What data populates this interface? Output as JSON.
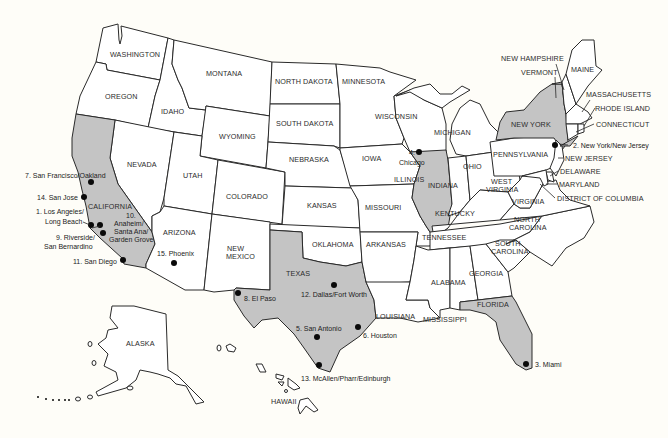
{
  "map": {
    "title": "",
    "highlight_color": "#c4c4c4",
    "background_color": "#fefdf8",
    "highlighted_states": [
      "CALIFORNIA",
      "TEXAS",
      "ILLINOIS",
      "NEW YORK",
      "FLORIDA"
    ],
    "state_labels": {
      "washington": "WASHINGTON",
      "oregon": "OREGON",
      "idaho": "IDAHO",
      "montana": "MONTANA",
      "wyoming": "WYOMING",
      "nevada": "NEVADA",
      "california": "CALIFORNIA",
      "utah": "UTAH",
      "colorado": "COLORADO",
      "arizona": "ARIZONA",
      "new_mexico_1": "NEW",
      "new_mexico_2": "MEXICO",
      "north_dakota": "NORTH DAKOTA",
      "south_dakota": "SOUTH DAKOTA",
      "nebraska": "NEBRASKA",
      "kansas": "KANSAS",
      "oklahoma": "OKLAHOMA",
      "texas": "TEXAS",
      "minnesota": "MINNESOTA",
      "iowa": "IOWA",
      "missouri": "MISSOURI",
      "arkansas": "ARKANSAS",
      "louisiana": "LOUISIANA",
      "wisconsin": "WISCONSIN",
      "illinois": "ILLINOIS",
      "michigan": "MICHIGAN",
      "indiana": "INDIANA",
      "ohio": "OHIO",
      "kentucky": "KENTUCKY",
      "tennessee": "TENNESSEE",
      "mississippi": "MISSISSIPPI",
      "alabama": "ALABAMA",
      "georgia": "GEORGIA",
      "florida": "FLORIDA",
      "south_carolina_1": "SOUTH",
      "south_carolina_2": "CAROLINA",
      "north_carolina_1": "NORTH",
      "north_carolina_2": "CAROLINA",
      "virginia": "VIRGINIA",
      "west_virginia_1": "WEST",
      "west_virginia_2": "VIRGINIA",
      "pennsylvania": "PENNSYLVANIA",
      "new_york": "NEW YORK",
      "vermont": "VERMONT",
      "new_hampshire": "NEW HAMPSHIRE",
      "maine": "MAINE",
      "massachusetts": "MASSACHUSETTS",
      "rhode_island": "RHODE ISLAND",
      "connecticut": "CONNECTICUT",
      "new_jersey": "NEW JERSEY",
      "delaware": "DELAWARE",
      "maryland": "MARYLAND",
      "dc": "DISTRICT OF COLUMBIA",
      "alaska": "ALASKA",
      "hawaii": "HAWAII"
    },
    "cities": [
      {
        "rank": 1,
        "label_1": "1. Los Angeles/",
        "label_2": "Long Beach",
        "state": "CALIFORNIA"
      },
      {
        "rank": 2,
        "label_1": "2. New York/New Jersey",
        "state": "NEW YORK"
      },
      {
        "rank": 3,
        "label_1": "3. Miami",
        "state": "FLORIDA"
      },
      {
        "rank": 4,
        "label_1": "4.",
        "label_2": "Chicago",
        "state": "ILLINOIS"
      },
      {
        "rank": 5,
        "label_1": "5. San Antonio",
        "state": "TEXAS"
      },
      {
        "rank": 6,
        "label_1": "6. Houston",
        "state": "TEXAS"
      },
      {
        "rank": 7,
        "label_1": "7. San Francisco/Oakland",
        "state": "CALIFORNIA"
      },
      {
        "rank": 8,
        "label_1": "8. El Paso",
        "state": "TEXAS"
      },
      {
        "rank": 9,
        "label_1": "9. Riverside/",
        "label_2": "San Bernardino",
        "state": "CALIFORNIA"
      },
      {
        "rank": 10,
        "label_1": "10.",
        "label_2": "Anaheim/",
        "label_3": "Santa Ana/",
        "label_4": "Garden Grove",
        "state": "CALIFORNIA"
      },
      {
        "rank": 11,
        "label_1": "11. San Diego",
        "state": "CALIFORNIA"
      },
      {
        "rank": 12,
        "label_1": "12. Dallas/Fort Worth",
        "state": "TEXAS"
      },
      {
        "rank": 13,
        "label_1": "13. McAllen/Pharr/Edinburgh",
        "state": "TEXAS"
      },
      {
        "rank": 14,
        "label_1": "14. San Jose",
        "state": "CALIFORNIA"
      },
      {
        "rank": 15,
        "label_1": "15. Phoenix",
        "state": "ARIZONA"
      }
    ]
  }
}
